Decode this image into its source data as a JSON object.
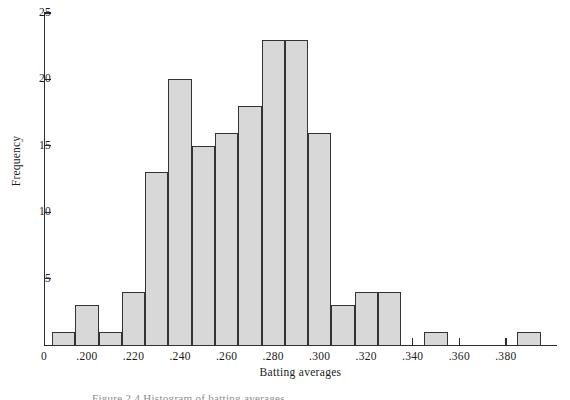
{
  "figure": {
    "caption": "Figure 2.4   Histogram of batting averages"
  },
  "axes": {
    "y_title": "Frequency",
    "x_title": "Batting averages",
    "y_ticks": [
      {
        "value": 0,
        "label": ""
      },
      {
        "value": 5,
        "label": "5"
      },
      {
        "value": 10,
        "label": "10"
      },
      {
        "value": 15,
        "label": "15"
      },
      {
        "value": 20,
        "label": "20"
      },
      {
        "value": 25,
        "label": "25"
      }
    ],
    "x_ticks": [
      {
        "value": 0.0,
        "label": "0"
      },
      {
        "value": 0.2,
        "label": ".200"
      },
      {
        "value": 0.22,
        "label": ".220"
      },
      {
        "value": 0.24,
        "label": ".240"
      },
      {
        "value": 0.26,
        "label": ".260"
      },
      {
        "value": 0.28,
        "label": ".280"
      },
      {
        "value": 0.3,
        "label": ".300"
      },
      {
        "value": 0.32,
        "label": ".320"
      },
      {
        "value": 0.34,
        "label": ".340"
      },
      {
        "value": 0.36,
        "label": ".360"
      },
      {
        "value": 0.38,
        "label": ".380"
      }
    ]
  },
  "style": {
    "bar_fill": "#d8d8d8",
    "bar_stroke": "#333333",
    "axis_color": "#2b2b2b",
    "background": "#ffffff"
  },
  "chart_data": {
    "type": "bar",
    "title": "",
    "xlabel": "Batting averages",
    "ylabel": "Frequency",
    "grid": false,
    "legend": "none",
    "xlim": [
      0.185,
      0.405
    ],
    "ylim": [
      0,
      25
    ],
    "bin_width": 0.01,
    "categories": [
      ".185-.195",
      ".195-.205",
      ".205-.215",
      ".215-.225",
      ".225-.235",
      ".235-.245",
      ".245-.255",
      ".255-.265",
      ".265-.275",
      ".275-.285",
      ".285-.295",
      ".295-.305",
      ".305-.315",
      ".315-.325",
      ".325-.335",
      ".335-.345",
      ".345-.355",
      ".355-.365",
      ".365-.375",
      ".375-.385",
      ".385-.395"
    ],
    "bin_starts": [
      0.185,
      0.195,
      0.205,
      0.215,
      0.225,
      0.235,
      0.245,
      0.255,
      0.265,
      0.275,
      0.285,
      0.295,
      0.305,
      0.315,
      0.325,
      0.335,
      0.345,
      0.355,
      0.365,
      0.375,
      0.385
    ],
    "values": [
      1,
      3,
      1,
      4,
      13,
      20,
      15,
      16,
      18,
      23,
      23,
      16,
      3,
      4,
      4,
      0,
      1,
      0,
      0,
      0,
      1
    ]
  }
}
